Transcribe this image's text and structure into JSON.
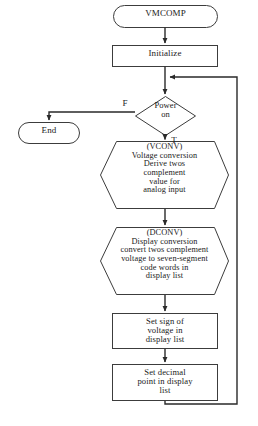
{
  "diagram": {
    "stroke_color": "#3c3c3c",
    "text_color": "#1a1a1a",
    "background": "#ffffff"
  },
  "nodes": {
    "start": {
      "shape": "terminator",
      "label": "VMCOMP"
    },
    "initialize": {
      "shape": "process",
      "label": "Initialize"
    },
    "power_on": {
      "shape": "decision",
      "label": "Power\non"
    },
    "end": {
      "shape": "terminator",
      "label": "End"
    },
    "vconv": {
      "shape": "hexagon",
      "label": "(VCONV)\nVoltage conversion\nDerive twos\ncomplement\nvalue for\nanalog input"
    },
    "dconv": {
      "shape": "hexagon",
      "label": "(DCONV)\nDisplay conversion\nconvert twos complement\nvoltage to seven-segment\ncode words in\ndisplay list"
    },
    "set_sign": {
      "shape": "process",
      "label": "Set sign of\nvoltage in\ndisplay list"
    },
    "set_decimal": {
      "shape": "process",
      "label": "Set decimal\npoint in display\nlist"
    }
  },
  "edge_labels": {
    "false_branch": "F",
    "true_branch": "T"
  }
}
